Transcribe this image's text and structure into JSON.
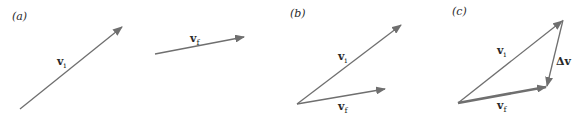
{
  "colors": {
    "arrow": "#6f6f6f",
    "text": "#2a2a2a",
    "background": "#ffffff"
  },
  "panels": [
    {
      "label": "(a)",
      "vectors": [
        {
          "name": "v",
          "subscript": "i",
          "from": [
            20,
            109
          ],
          "to": [
            123,
            26
          ]
        },
        {
          "name": "v",
          "subscript": "f",
          "from": [
            155,
            54
          ],
          "to": [
            245,
            37
          ]
        }
      ]
    },
    {
      "label": "(b)",
      "vectors": [
        {
          "name": "v",
          "subscript": "i",
          "from": [
            297,
            104
          ],
          "to": [
            402,
            24
          ]
        },
        {
          "name": "v",
          "subscript": "f",
          "from": [
            297,
            104
          ],
          "to": [
            386,
            89
          ]
        }
      ]
    },
    {
      "label": "(c)",
      "vectors": [
        {
          "name": "v",
          "subscript": "i",
          "from": [
            458,
            103
          ],
          "to": [
            563,
            20
          ]
        },
        {
          "name": "v",
          "subscript": "f",
          "from": [
            458,
            103
          ],
          "to": [
            547,
            87
          ],
          "emphasis": "thick"
        },
        {
          "name": "Δv",
          "subscript": "",
          "from": [
            563,
            20
          ],
          "to": [
            547,
            87
          ]
        }
      ]
    }
  ],
  "labels": {
    "a": "(a)",
    "b": "(b)",
    "c": "(c)",
    "v": "v",
    "i": "i",
    "f": "f",
    "dv": "Δv"
  }
}
